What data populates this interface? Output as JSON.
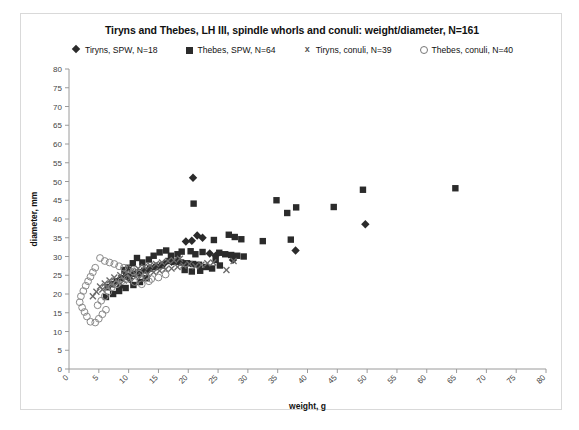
{
  "chart_data": {
    "type": "scatter",
    "title": "Tiryns and Thebes, LH III, spindle whorls and conuli: weight/diameter, N=161",
    "xlabel": "weight, g",
    "ylabel": "diameter, mm",
    "xlim": [
      0,
      80
    ],
    "ylim": [
      0,
      80
    ],
    "xticks": [
      0,
      5,
      10,
      15,
      20,
      25,
      30,
      35,
      40,
      45,
      50,
      55,
      60,
      65,
      70,
      75,
      80
    ],
    "yticks": [
      0,
      5,
      10,
      15,
      20,
      25,
      30,
      35,
      40,
      45,
      50,
      55,
      60,
      65,
      70,
      75,
      80
    ],
    "grid": false,
    "legend_position": "top",
    "series": [
      {
        "name": "Tiryns, SPW, N=18",
        "marker": "diamond",
        "color": "#2b2b2b",
        "count": 18,
        "points": [
          [
            20.8,
            51.0
          ],
          [
            21.5,
            35.6
          ],
          [
            22.4,
            35.0
          ],
          [
            19.6,
            34.0
          ],
          [
            20.6,
            34.2
          ],
          [
            23.6,
            30.8
          ],
          [
            24.6,
            30.2
          ],
          [
            27.5,
            29.1
          ],
          [
            38.0,
            31.6
          ],
          [
            49.7,
            38.6
          ],
          [
            18.2,
            29.0
          ],
          [
            17.2,
            28.6
          ],
          [
            16.0,
            28.2
          ],
          [
            14.6,
            27.4
          ],
          [
            13.3,
            26.4
          ],
          [
            11.8,
            25.2
          ],
          [
            10.2,
            24.0
          ],
          [
            8.6,
            22.0
          ]
        ]
      },
      {
        "name": "Thebes, SPW, N=64",
        "marker": "square",
        "color": "#2b2b2b",
        "count": 64,
        "points": [
          [
            20.9,
            44.1
          ],
          [
            34.8,
            45.0
          ],
          [
            36.6,
            41.6
          ],
          [
            38.1,
            43.1
          ],
          [
            44.4,
            43.2
          ],
          [
            49.3,
            47.8
          ],
          [
            64.8,
            48.2
          ],
          [
            32.5,
            34.1
          ],
          [
            37.2,
            34.5
          ],
          [
            26.8,
            35.8
          ],
          [
            27.8,
            35.2
          ],
          [
            28.9,
            34.6
          ],
          [
            24.3,
            34.4
          ],
          [
            22.4,
            31.2
          ],
          [
            25.2,
            31.0
          ],
          [
            26.2,
            30.6
          ],
          [
            27.2,
            30.4
          ],
          [
            28.2,
            30.2
          ],
          [
            29.3,
            30.0
          ],
          [
            24.6,
            29.1
          ],
          [
            21.2,
            30.6
          ],
          [
            20.4,
            31.4
          ],
          [
            18.9,
            31.3
          ],
          [
            18.2,
            30.6
          ],
          [
            17.1,
            30.2
          ],
          [
            16.3,
            31.6
          ],
          [
            15.2,
            31.1
          ],
          [
            14.2,
            30.2
          ],
          [
            13.4,
            29.2
          ],
          [
            12.3,
            28.4
          ],
          [
            11.4,
            29.6
          ],
          [
            10.7,
            28.2
          ],
          [
            10.0,
            27.0
          ],
          [
            9.3,
            26.4
          ],
          [
            16.8,
            28.8
          ],
          [
            17.8,
            28.6
          ],
          [
            18.8,
            28.4
          ],
          [
            19.8,
            28.2
          ],
          [
            20.8,
            28.0
          ],
          [
            21.8,
            27.8
          ],
          [
            15.6,
            27.6
          ],
          [
            14.6,
            27.2
          ],
          [
            13.6,
            26.8
          ],
          [
            12.6,
            26.2
          ],
          [
            11.6,
            25.8
          ],
          [
            10.6,
            25.4
          ],
          [
            9.6,
            24.8
          ],
          [
            8.8,
            24.2
          ],
          [
            8.0,
            23.4
          ],
          [
            7.2,
            22.6
          ],
          [
            6.5,
            21.8
          ],
          [
            19.4,
            26.4
          ],
          [
            20.6,
            26.0
          ],
          [
            22.0,
            26.2
          ],
          [
            23.0,
            27.2
          ],
          [
            24.0,
            26.8
          ],
          [
            25.3,
            27.6
          ],
          [
            13.0,
            24.2
          ],
          [
            11.9,
            23.2
          ],
          [
            10.8,
            22.4
          ],
          [
            9.5,
            21.6
          ],
          [
            8.4,
            20.8
          ],
          [
            7.4,
            20.0
          ],
          [
            6.2,
            19.2
          ]
        ]
      },
      {
        "name": "Tiryns, conuli, N=39",
        "marker": "x",
        "color": "#6a6a6a",
        "count": 39,
        "points": [
          [
            27.6,
            28.8
          ],
          [
            26.4,
            26.4
          ],
          [
            24.2,
            28.4
          ],
          [
            23.2,
            28.2
          ],
          [
            22.2,
            27.8
          ],
          [
            21.2,
            27.4
          ],
          [
            20.2,
            28.0
          ],
          [
            19.2,
            27.6
          ],
          [
            18.2,
            27.2
          ],
          [
            17.2,
            26.8
          ],
          [
            16.2,
            26.6
          ],
          [
            15.2,
            26.2
          ],
          [
            14.2,
            25.8
          ],
          [
            13.2,
            25.4
          ],
          [
            12.2,
            25.0
          ],
          [
            11.2,
            24.6
          ],
          [
            10.2,
            24.2
          ],
          [
            9.2,
            23.6
          ],
          [
            8.2,
            23.0
          ],
          [
            7.2,
            22.4
          ],
          [
            6.4,
            21.8
          ],
          [
            5.6,
            21.2
          ],
          [
            18.6,
            29.4
          ],
          [
            17.6,
            29.0
          ],
          [
            16.6,
            28.8
          ],
          [
            15.6,
            28.4
          ],
          [
            14.6,
            28.0
          ],
          [
            13.6,
            27.6
          ],
          [
            12.6,
            27.2
          ],
          [
            11.6,
            26.8
          ],
          [
            10.6,
            26.2
          ],
          [
            9.6,
            25.6
          ],
          [
            8.6,
            25.0
          ],
          [
            7.6,
            24.4
          ],
          [
            6.8,
            23.6
          ],
          [
            6.0,
            22.8
          ],
          [
            5.2,
            22.0
          ],
          [
            4.6,
            20.6
          ],
          [
            4.0,
            19.4
          ]
        ]
      },
      {
        "name": "Thebes, conuli, N=40",
        "marker": "circle",
        "color": "#8a8a8a",
        "count": 40,
        "points": [
          [
            5.2,
            29.6
          ],
          [
            6.0,
            28.8
          ],
          [
            6.8,
            28.4
          ],
          [
            7.6,
            28.0
          ],
          [
            8.4,
            27.4
          ],
          [
            9.2,
            27.0
          ],
          [
            10.0,
            26.6
          ],
          [
            10.8,
            26.0
          ],
          [
            11.8,
            25.4
          ],
          [
            12.8,
            24.6
          ],
          [
            13.8,
            24.0
          ],
          [
            15.0,
            24.4
          ],
          [
            16.2,
            25.2
          ],
          [
            4.4,
            27.0
          ],
          [
            4.0,
            25.8
          ],
          [
            3.6,
            24.6
          ],
          [
            3.2,
            23.4
          ],
          [
            2.8,
            22.2
          ],
          [
            2.4,
            20.8
          ],
          [
            2.0,
            19.4
          ],
          [
            1.8,
            17.8
          ],
          [
            2.2,
            16.4
          ],
          [
            2.6,
            15.2
          ],
          [
            3.0,
            14.0
          ],
          [
            3.6,
            12.6
          ],
          [
            4.4,
            12.4
          ],
          [
            5.0,
            13.4
          ],
          [
            5.6,
            14.6
          ],
          [
            6.2,
            15.8
          ],
          [
            4.8,
            17.0
          ],
          [
            5.4,
            18.2
          ],
          [
            6.0,
            19.4
          ],
          [
            6.6,
            20.6
          ],
          [
            7.2,
            21.8
          ],
          [
            8.0,
            22.6
          ],
          [
            8.8,
            23.4
          ],
          [
            9.8,
            24.0
          ],
          [
            11.0,
            23.2
          ],
          [
            12.2,
            22.6
          ],
          [
            13.4,
            23.4
          ]
        ]
      }
    ]
  },
  "legend": {
    "items": [
      {
        "label": "Tiryns, SPW, N=18",
        "marker": "diamond"
      },
      {
        "label": "Thebes, SPW, N=64",
        "marker": "square"
      },
      {
        "label": "Tiryns, conuli, N=39",
        "marker": "x"
      },
      {
        "label": "Thebes, conuli, N=40",
        "marker": "circle"
      }
    ]
  }
}
